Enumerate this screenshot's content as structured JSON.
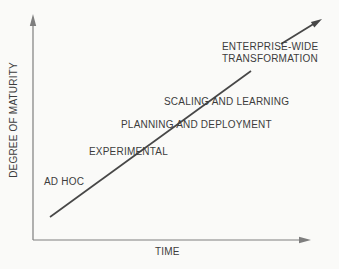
{
  "diagram": {
    "y_axis_label": "DEGREE OF MATURITY",
    "x_axis_label": "TIME",
    "stages": [
      {
        "label": "AD HOC"
      },
      {
        "label": "EXPERIMENTAL"
      },
      {
        "label": "PLANNING AND DEPLOYMENT"
      },
      {
        "label": "SCALING AND LEARNING"
      },
      {
        "label": "ENTERPRISE-WIDE TRANSFORMATION"
      }
    ],
    "colors": {
      "background": "#fafaf8",
      "text": "#3c3c3c",
      "axis": "#7e7e7e",
      "trend_line": "#474747"
    }
  }
}
